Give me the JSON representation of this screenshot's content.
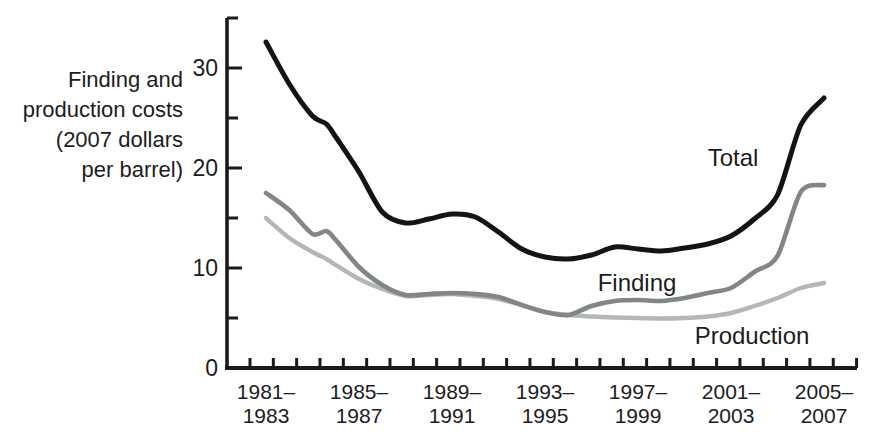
{
  "figure": {
    "axis_label_lines": [
      "Finding and",
      "production costs",
      "(2007 dollars",
      "per barrel)"
    ]
  },
  "chart_data": {
    "type": "line",
    "title": "",
    "xlabel": "",
    "ylabel": "Finding and production costs (2007 dollars per barrel)",
    "x_unit": "three-year periods (annual moving averages)",
    "grid": false,
    "legend_position": "inline-annotations",
    "ylim": [
      0,
      35
    ],
    "y_ticks_major": [
      0,
      10,
      20,
      30
    ],
    "y_ticks_minor": [
      5,
      15,
      25,
      35
    ],
    "year_tick_range": [
      1981,
      2007
    ],
    "x": [
      1982,
      1983,
      1984,
      1984.6,
      1985,
      1986,
      1987,
      1988,
      1989,
      1990,
      1991,
      1992,
      1993,
      1994,
      1995,
      1996,
      1997,
      1998,
      1999,
      2000,
      2001,
      2002,
      2003,
      2004,
      2005,
      2006
    ],
    "x_tick_labels": [
      {
        "line1": "1981–",
        "line2": "1983",
        "year_center": 1982
      },
      {
        "line1": "1985–",
        "line2": "1987",
        "year_center": 1986
      },
      {
        "line1": "1989–",
        "line2": "1991",
        "year_center": 1990
      },
      {
        "line1": "1993–",
        "line2": "1995",
        "year_center": 1994
      },
      {
        "line1": "1997–",
        "line2": "1999",
        "year_center": 1998
      },
      {
        "line1": "2001–",
        "line2": "2003",
        "year_center": 2002
      },
      {
        "line1": "2005–",
        "line2": "2007",
        "year_center": 2006
      }
    ],
    "series": [
      {
        "name": "Production",
        "color": "#b3b8b6",
        "stroke_width": 4.4,
        "values": [
          15.0,
          13.0,
          11.6,
          10.9,
          10.3,
          8.9,
          7.9,
          7.2,
          7.3,
          7.4,
          7.2,
          6.9,
          6.3,
          5.6,
          5.3,
          5.15,
          5.05,
          5.0,
          4.95,
          5.0,
          5.15,
          5.5,
          6.2,
          7.0,
          8.0,
          8.5
        ]
      },
      {
        "name": "Finding",
        "color": "#828686",
        "stroke_width": 4.6,
        "values": [
          17.5,
          15.8,
          13.4,
          13.7,
          12.8,
          10.1,
          8.3,
          7.3,
          7.4,
          7.5,
          7.4,
          7.1,
          6.3,
          5.6,
          5.3,
          6.2,
          6.7,
          6.8,
          6.7,
          7.0,
          7.5,
          8.0,
          9.6,
          11.2,
          17.6,
          18.3
        ]
      },
      {
        "name": "Total",
        "color": "#141414",
        "stroke_width": 5.0,
        "values": [
          32.6,
          28.4,
          25.2,
          24.4,
          23.1,
          19.6,
          15.6,
          14.5,
          14.9,
          15.4,
          15.1,
          13.6,
          11.9,
          11.1,
          10.9,
          11.3,
          12.1,
          11.9,
          11.7,
          12.0,
          12.4,
          13.2,
          14.9,
          17.3,
          24.3,
          27.0
        ]
      }
    ],
    "annotations": [
      {
        "text": "Total",
        "x": 733,
        "y": 166
      },
      {
        "text": "Finding",
        "x": 637,
        "y": 291
      },
      {
        "text": "Production",
        "x": 752,
        "y": 344
      }
    ]
  }
}
